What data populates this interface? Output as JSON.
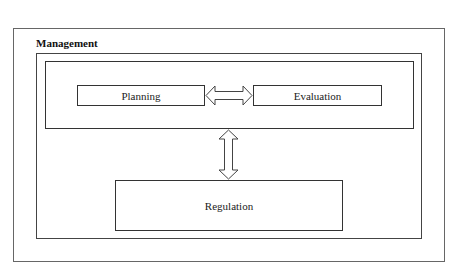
{
  "diagram": {
    "title": "Management",
    "nodes": {
      "planning": "Planning",
      "evaluation": "Evaluation",
      "regulation": "Regulation"
    },
    "connections": [
      {
        "from": "Planning",
        "to": "Evaluation",
        "type": "bidirectional-hollow-arrow"
      },
      {
        "from": "Planning/Evaluation group",
        "to": "Regulation",
        "type": "bidirectional-hollow-arrow"
      }
    ],
    "containers": [
      "outer frame",
      "Management boundary",
      "Planning-Evaluation group"
    ],
    "colors": {
      "line": "#444444",
      "background": "#ffffff",
      "text": "#222222"
    }
  }
}
